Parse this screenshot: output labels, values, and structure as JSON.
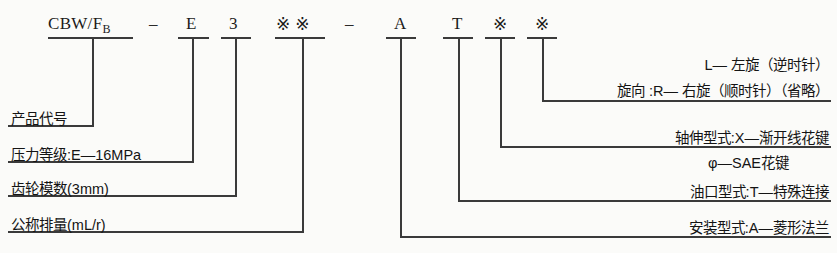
{
  "diagram": {
    "code_row": {
      "segments": [
        {
          "id": "product-code",
          "text": "CBW/F",
          "subscript": "B"
        },
        {
          "id": "separator-1",
          "text": "–"
        },
        {
          "id": "pressure-grade",
          "text": "E"
        },
        {
          "id": "gear-module",
          "text": "3"
        },
        {
          "id": "displacement",
          "text": "※※"
        },
        {
          "id": "separator-2",
          "text": "–"
        },
        {
          "id": "mounting-type",
          "text": "A"
        },
        {
          "id": "port-type",
          "text": "T"
        },
        {
          "id": "shaft-type",
          "text": "※"
        },
        {
          "id": "rotation-dir",
          "text": "※"
        }
      ]
    },
    "left_labels": [
      {
        "id": "product-code-label",
        "text": "产品代号"
      },
      {
        "id": "pressure-grade-label",
        "text": "压力等级:E—16MPa"
      },
      {
        "id": "gear-module-label",
        "text": "齿轮模数(3mm)"
      },
      {
        "id": "displacement-label",
        "text": "公称排量(mL/r)"
      }
    ],
    "right_labels": [
      {
        "id": "rotation-line-1",
        "text": "L— 左旋（逆时针）"
      },
      {
        "id": "rotation-line-2",
        "text": "旋向 :R— 右旋（顺时针）（省略）"
      },
      {
        "id": "shaft-line-1",
        "text": "轴伸型式:X—渐开线花键"
      },
      {
        "id": "shaft-line-2",
        "text": "φ—SAE花键"
      },
      {
        "id": "port-label",
        "text": "油口型式:T—特殊连接"
      },
      {
        "id": "mounting-label",
        "text": "安装型式:A—菱形法兰"
      }
    ],
    "colors": {
      "background": "#fbfbf9",
      "ink": "#1d1d1d",
      "line": "#3a3a3a"
    }
  }
}
